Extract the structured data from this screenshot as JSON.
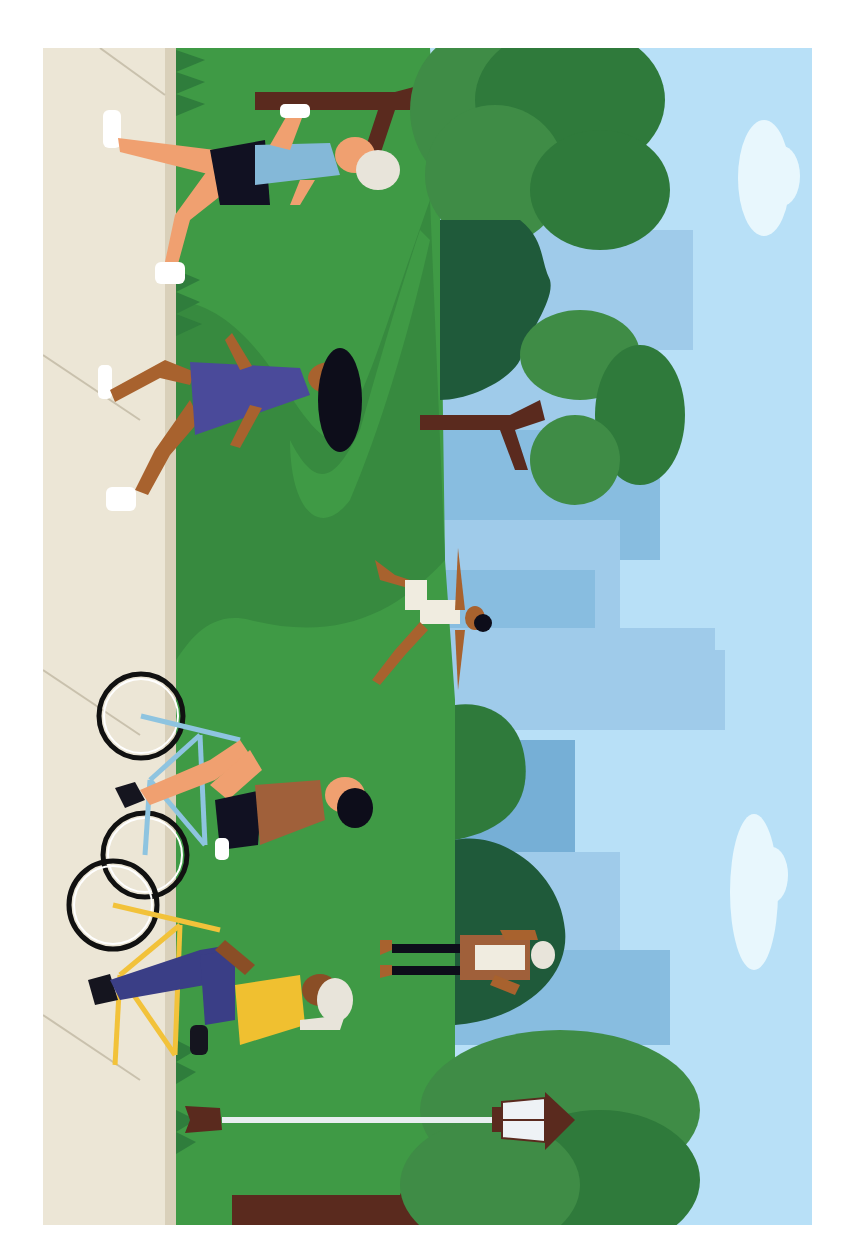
{
  "illustration": {
    "title": "Park scene illustration (rotated 90°)",
    "frame": {
      "x": 43,
      "y": 48,
      "w": 769,
      "h": 1177
    },
    "colors": {
      "border": "#ffffff",
      "sidewalk": "#ece6d6",
      "sidewalk_edge": "#d9d0ba",
      "sidewalk_line": "#c9c1ad",
      "grass": "#3f9a45",
      "grass_dark": "#378a3f",
      "grass_tufts": "#2f7d3c",
      "sky": "#b8e0f7",
      "building_light": "#9fcbea",
      "building_mid": "#88bde0",
      "building_dark": "#76afd6",
      "cloud": "#e8f7fd",
      "tree_light": "#3f8c46",
      "tree_mid": "#2f7a3b",
      "tree_dark": "#1f5a3a",
      "trunk": "#5a2a1e",
      "skin_tan": "#f0a070",
      "skin_brown": "#a8622e",
      "skin_dark": "#8a4e26",
      "hair_black": "#0d0d1a",
      "hair_white": "#e8e4da",
      "shorts_black": "#111122",
      "shirt_blue": "#84b8d8",
      "dress_purple": "#4a4a9a",
      "shirt_brown": "#a0603a",
      "shirt_yellow": "#f0c030",
      "pants_navy": "#3a3e86",
      "bike_blue": "#8ec4e0",
      "bike_yellow": "#f2c23a",
      "shoe_white": "#ffffff",
      "shoe_black": "#15151f",
      "lamp_post": "#e8eef0",
      "lamp_glass": "#eef2f5"
    },
    "people": [
      {
        "role": "jogger-with-bottle",
        "hair": "white",
        "top": "blue"
      },
      {
        "role": "jogger-ponytail",
        "hair": "black",
        "top": "purple-dress"
      },
      {
        "role": "yoga-person",
        "hair": "black",
        "top": "cream"
      },
      {
        "role": "cyclist-blue-bike",
        "hair": "black",
        "top": "brown"
      },
      {
        "role": "cyclist-yellow-bike",
        "hair": "white",
        "top": "yellow"
      },
      {
        "role": "walker-standing",
        "hair": "white",
        "top": "brown-jacket"
      }
    ],
    "objects": [
      "trees",
      "city-skyline",
      "clouds",
      "lamp-post",
      "sidewalk",
      "bicycles"
    ]
  }
}
